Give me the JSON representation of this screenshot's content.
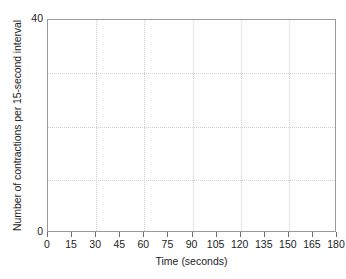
{
  "chart_data": {
    "type": "line",
    "title": "",
    "xlabel": "Time (seconds)",
    "ylabel": "Number of contractions per 15-second interval",
    "xlim": [
      0,
      180
    ],
    "ylim": [
      0,
      40
    ],
    "x_tick_labels": [
      "0",
      "15",
      "30",
      "45",
      "60",
      "75",
      "90",
      "105",
      "120",
      "135",
      "150",
      "165",
      "180"
    ],
    "x_tick_values": [
      0,
      15,
      30,
      45,
      60,
      75,
      90,
      105,
      120,
      135,
      150,
      165,
      180
    ],
    "y_tick_labels": [
      "0",
      "40"
    ],
    "y_tick_values": [
      0,
      40
    ],
    "x_gridlines": [
      30,
      60,
      90,
      120,
      150
    ],
    "y_gridlines": [
      10,
      20,
      30
    ],
    "grid": true,
    "grid_color": "#cfcfcf",
    "frame_color": "#9a9a9a",
    "background": "#ffffff",
    "legend": null,
    "series": [],
    "annotations": [],
    "note": "Blank plotting grid; no data series are drawn in the axes area."
  }
}
